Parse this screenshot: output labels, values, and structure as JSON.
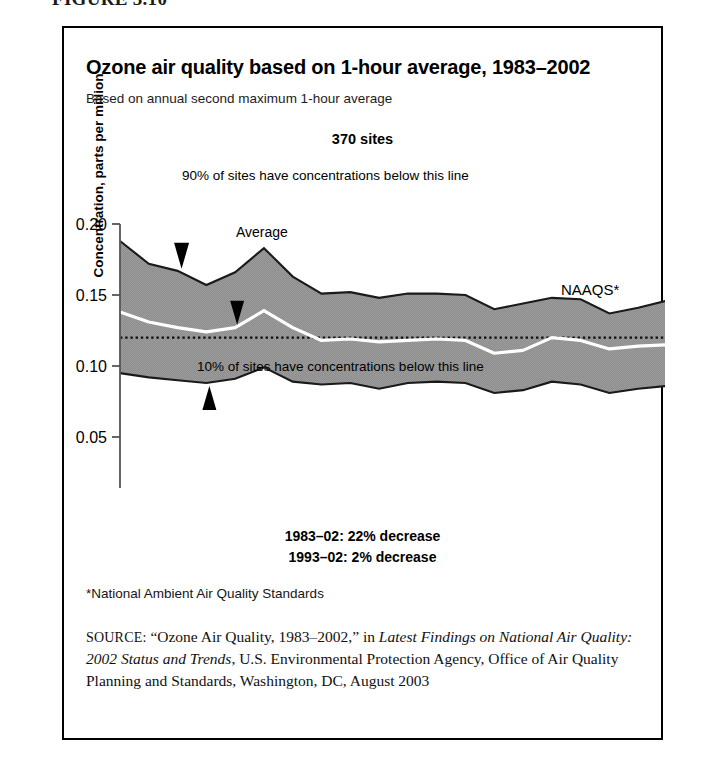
{
  "figure": {
    "label": "FIGURE 3.10"
  },
  "header": {
    "title": "Ozone air quality based on 1-hour average, 1983–2002",
    "subtitle": "Based on annual second maximum 1-hour average",
    "sites_label": "370 sites"
  },
  "annotations": {
    "upper_band": "90% of sites have concentrations below this line",
    "average": "Average",
    "lower_band": "10% of sites have concentrations below this line",
    "naaqs": "NAAQS*"
  },
  "notes": {
    "trend_long": "1983–02: 22% decrease",
    "trend_short": "1993–02: 2% decrease",
    "footnote": "*National Ambient Air Quality Standards"
  },
  "source": {
    "prefix": "SOURCE:",
    "quoted_title": "“Ozone Air Quality, 1983–2002,”",
    "connector": "in",
    "italic_title": "Latest Findings on National Air Quality: 2002 Status and Trends",
    "rest": ", U.S. Environmental Protection Agency, Office of Air Quality Planning and Standards, Washington, DC, August 2003"
  },
  "chart_data": {
    "type": "area",
    "title": "Ozone air quality based on 1-hour average, 1983–2002",
    "subtitle": "Based on annual second maximum 1-hour average",
    "xlabel": "",
    "ylabel": "Concentration, parts per million",
    "xlim": [
      1983,
      2002
    ],
    "ylim": [
      0.0,
      0.2
    ],
    "yticks": [
      0.0,
      0.05,
      0.1,
      0.15,
      0.2
    ],
    "ytick_labels": [
      "0.00",
      "0.05",
      "0.10",
      "0.15",
      "0.20"
    ],
    "x": [
      1983,
      1984,
      1985,
      1986,
      1987,
      1988,
      1989,
      1990,
      1991,
      1992,
      1993,
      1994,
      1995,
      1996,
      1997,
      1998,
      1999,
      2000,
      2001,
      2002
    ],
    "xtick_labels": [
      "83",
      "84",
      "85",
      "86",
      "87",
      "88",
      "89",
      "90",
      "91",
      "92",
      "93",
      "94",
      "95",
      "96",
      "97",
      "98",
      "99",
      "00",
      "01",
      "02"
    ],
    "grid": false,
    "legend": "annotated-inline",
    "band_fill_color": "#8c8c8c",
    "band_edge_color": "#1a1a1a",
    "average_line_color": "#ffffff",
    "reference_line_color": "#1a1a1a",
    "series": [
      {
        "name": "90% of sites have concentrations below this line",
        "role": "upper",
        "values": [
          0.188,
          0.172,
          0.167,
          0.157,
          0.166,
          0.183,
          0.163,
          0.151,
          0.152,
          0.148,
          0.151,
          0.151,
          0.15,
          0.14,
          0.144,
          0.148,
          0.147,
          0.137,
          0.141,
          0.146
        ]
      },
      {
        "name": "Average",
        "role": "average",
        "values": [
          0.138,
          0.131,
          0.127,
          0.124,
          0.127,
          0.139,
          0.127,
          0.118,
          0.119,
          0.117,
          0.118,
          0.119,
          0.118,
          0.109,
          0.111,
          0.12,
          0.118,
          0.112,
          0.114,
          0.115
        ]
      },
      {
        "name": "10% of sites have concentrations below this line",
        "role": "lower",
        "values": [
          0.095,
          0.092,
          0.09,
          0.088,
          0.091,
          0.099,
          0.089,
          0.087,
          0.088,
          0.084,
          0.088,
          0.089,
          0.088,
          0.081,
          0.083,
          0.089,
          0.087,
          0.081,
          0.084,
          0.086
        ]
      }
    ],
    "reference_line": {
      "name": "NAAQS*",
      "value": 0.12,
      "style": "dotted"
    },
    "annotations": [
      {
        "text": "370 sites",
        "position": "above-plot-center"
      },
      {
        "text": "1983–02: 22% decrease",
        "position": "below-axis"
      },
      {
        "text": "1993–02: 2% decrease",
        "position": "below-axis"
      }
    ]
  }
}
